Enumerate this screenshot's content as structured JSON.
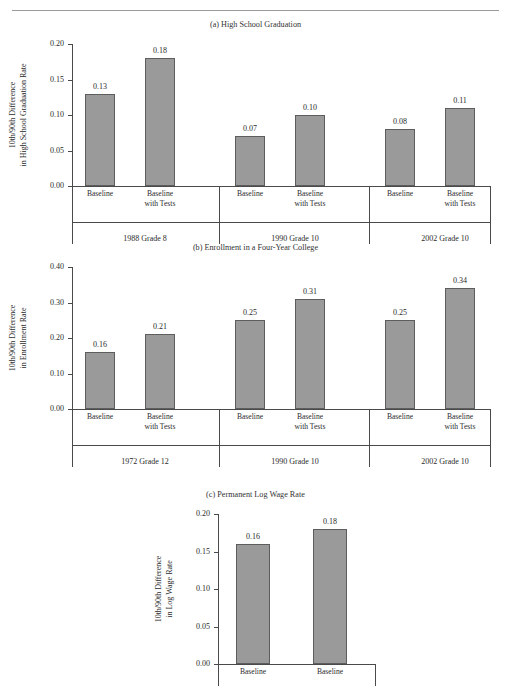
{
  "page": {
    "running_head": "",
    "smudge": ""
  },
  "chart_data": [
    {
      "type": "bar",
      "panel": "a",
      "title": "(a) High School Graduation",
      "ylabel_line1": "10th/90th Difference",
      "ylabel_line2": "in High School Graduation Rate",
      "ylim": [
        0.0,
        0.2
      ],
      "yticks": [
        "0.00",
        "0.05",
        "0.10",
        "0.15",
        "0.20"
      ],
      "ytick_values": [
        0.0,
        0.05,
        0.1,
        0.15,
        0.2
      ],
      "grid": false,
      "legend": "none",
      "categories": [
        "Baseline",
        "Baseline with Tests",
        "Baseline",
        "Baseline with Tests",
        "Baseline",
        "Baseline with Tests"
      ],
      "values": [
        0.13,
        0.18,
        0.07,
        0.1,
        0.08,
        0.11
      ],
      "value_labels": [
        "0.13",
        "0.18",
        "0.07",
        "0.10",
        "0.08",
        "0.11"
      ],
      "groups": [
        "1988 Grade 8",
        "1990 Grade 10",
        "2002 Grade 10"
      ]
    },
    {
      "type": "bar",
      "panel": "b",
      "title": "(b) Enrollment in a Four-Year College",
      "ylabel_line1": "10th/90th Difference",
      "ylabel_line2": "in Enrollment Rate",
      "ylim": [
        0.0,
        0.4
      ],
      "yticks": [
        "0.00",
        "0.10",
        "0.20",
        "0.30",
        "0.40"
      ],
      "ytick_values": [
        0.0,
        0.1,
        0.2,
        0.3,
        0.4
      ],
      "grid": false,
      "legend": "none",
      "categories": [
        "Baseline",
        "Baseline with Tests",
        "Baseline",
        "Baseline with Tests",
        "Baseline",
        "Baseline with Tests"
      ],
      "values": [
        0.16,
        0.21,
        0.25,
        0.31,
        0.25,
        0.34
      ],
      "value_labels": [
        "0.16",
        "0.21",
        "0.25",
        "0.31",
        "0.25",
        "0.34"
      ],
      "groups": [
        "1972 Grade 12",
        "1990 Grade 10",
        "2002 Grade 10"
      ]
    },
    {
      "type": "bar",
      "panel": "c",
      "title": "(c) Permanent Log Wage Rate",
      "ylabel_line1": "10th/90th Difference",
      "ylabel_line2": "in Log Wage Rate",
      "ylim": [
        0.0,
        0.2
      ],
      "yticks": [
        "0.00",
        "0.05",
        "0.10",
        "0.15",
        "0.20"
      ],
      "ytick_values": [
        0.0,
        0.05,
        0.1,
        0.15,
        0.2
      ],
      "grid": false,
      "legend": "none",
      "categories": [
        "Baseline",
        "Baseline"
      ],
      "values": [
        0.16,
        0.18
      ],
      "value_labels": [
        "0.16",
        "0.18"
      ],
      "groups": []
    }
  ],
  "colors": {
    "bar_fill": "#9a9a9a",
    "bar_stroke": "#5d5d5d",
    "axis": "#4a4a4a",
    "text": "#2b2b2b"
  }
}
